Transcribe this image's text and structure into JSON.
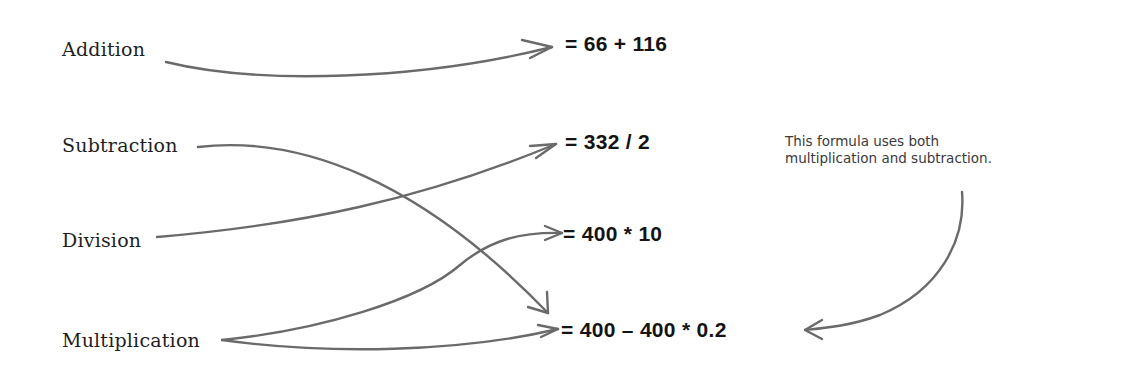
{
  "operations": [
    {
      "label": "Addition"
    },
    {
      "label": "Subtraction"
    },
    {
      "label": "Division"
    },
    {
      "label": "Multiplication"
    }
  ],
  "formulas": [
    {
      "text": "= 66 + 116"
    },
    {
      "text": "= 332 / 2"
    },
    {
      "text": "= 400 * 10"
    },
    {
      "text": "= 400 – 400 * 0.2"
    }
  ],
  "mappings": [
    {
      "from": "Addition",
      "to": "= 66 + 116"
    },
    {
      "from": "Subtraction",
      "to": "= 400 – 400 * 0.2"
    },
    {
      "from": "Division",
      "to": "= 332 / 2"
    },
    {
      "from": "Multiplication",
      "to": "= 400 * 10"
    },
    {
      "from": "Multiplication",
      "to": "= 400 – 400 * 0.2"
    }
  ],
  "annotation": {
    "line1": "This formula uses both",
    "line2": "multiplication and subtraction.",
    "points_to": "= 400 – 400 * 0.2"
  },
  "colors": {
    "arrow": "#6a6a6a",
    "text": "#1f1f1f",
    "background": "#ffffff"
  }
}
